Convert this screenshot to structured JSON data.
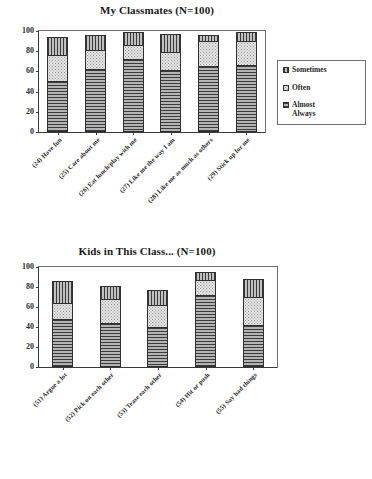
{
  "chart_data": [
    {
      "type": "bar",
      "id": "my-classmates",
      "title": "My Classmates (N=100)",
      "xlabel": "",
      "ylabel": "",
      "ylim": [
        0,
        100
      ],
      "yticks": [
        0,
        20,
        40,
        60,
        80,
        100
      ],
      "grid": false,
      "stacked": true,
      "legend_position": "right",
      "categories": [
        "(24) Have fun",
        "(25) Care about me",
        "(26) Eat lunch/play with me",
        "(27) Like me the way I am",
        "(28) Like me as much as others",
        "(29) Stick up for me"
      ],
      "series": [
        {
          "name": "Almost Always",
          "pattern": "horizontal-lines",
          "values": [
            50,
            62,
            72,
            61,
            65,
            66
          ]
        },
        {
          "name": "Often",
          "pattern": "dots",
          "values": [
            26,
            19,
            14,
            18,
            25,
            24
          ]
        },
        {
          "name": "Sometimes",
          "pattern": "vertical-lines",
          "values": [
            18,
            15,
            13,
            18,
            6,
            9
          ]
        }
      ],
      "totals": [
        94,
        96,
        99,
        97,
        96,
        99
      ],
      "legend_order": [
        "Sometimes",
        "Often",
        "Almost Always"
      ]
    },
    {
      "type": "bar",
      "id": "kids-in-this-class",
      "title": "Kids in This Class... (N=100)",
      "xlabel": "",
      "ylabel": "",
      "ylim": [
        0,
        100
      ],
      "yticks": [
        0,
        20,
        40,
        60,
        80,
        100
      ],
      "grid": false,
      "stacked": true,
      "legend_position": "right",
      "categories": [
        "(51) Argue a lot",
        "(52) Pick on each other",
        "(53) Tease each other",
        "(54) Hit or push",
        "(55) Say bad things"
      ],
      "series": [
        {
          "name": "Never",
          "pattern": "horizontal-lines",
          "values": [
            47,
            43,
            39,
            72,
            41
          ]
        },
        {
          "name": "Sometimes",
          "pattern": "dots",
          "values": [
            16,
            25,
            23,
            15,
            29
          ]
        },
        {
          "name": "Often",
          "pattern": "vertical-lines",
          "values": [
            23,
            13,
            15,
            8,
            18
          ]
        }
      ],
      "totals": [
        86,
        81,
        77,
        95,
        88
      ],
      "legend_order": [
        "Often",
        "Sometimes",
        "Never"
      ]
    }
  ],
  "charts": {
    "classmates": {
      "title": "My Classmates (N=100)",
      "yticks": [
        "100",
        "80",
        "60",
        "40",
        "20",
        "0"
      ],
      "xlabels": [
        "(24) Have fun",
        "(25) Care about me",
        "(26) Eat lunch/play with me",
        "(27) Like me the way I am",
        "(28) Like me as much as others",
        "(29) Stick up for me"
      ],
      "legend": [
        {
          "label": "Sometimes",
          "pattern": "vertical-lines"
        },
        {
          "label": "Often",
          "pattern": "dots"
        },
        {
          "label": "Almost\nAlways",
          "pattern": "horizontal-lines"
        }
      ]
    },
    "kids": {
      "title": "Kids in This Class... (N=100)",
      "yticks": [
        "100",
        "80",
        "60",
        "40",
        "20",
        "0"
      ],
      "xlabels": [
        "(51) Argue a lot",
        "(52) Pick on each other",
        "(53) Tease each other",
        "(54) Hit or push",
        "(55) Say bad things"
      ],
      "legend": [
        {
          "label": "Often",
          "pattern": "vertical-lines"
        },
        {
          "label": "Sometimes",
          "pattern": "dots"
        },
        {
          "label": "Never",
          "pattern": "horizontal-lines"
        }
      ]
    }
  }
}
